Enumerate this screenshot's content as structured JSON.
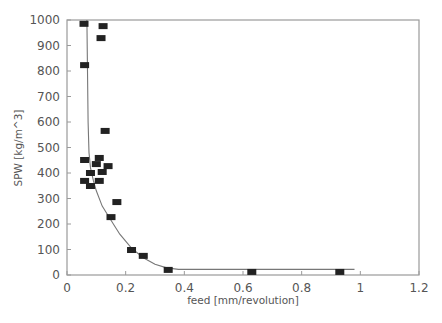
{
  "chart_data": {
    "type": "scatter",
    "title": "",
    "xlabel": "feed [mm/revolution]",
    "ylabel": "SPW [kg/m^3]",
    "xlim": [
      0,
      1.2
    ],
    "ylim": [
      0,
      1000
    ],
    "xticks": [
      0,
      0.2,
      0.4,
      0.6,
      0.8,
      1,
      1.2
    ],
    "xtick_labels": [
      "0",
      "0.2",
      "0.4",
      "0.6",
      "0.8",
      "1",
      "1.2"
    ],
    "yticks": [
      0,
      100,
      200,
      300,
      400,
      500,
      600,
      700,
      800,
      900,
      1000
    ],
    "ytick_labels": [
      "0",
      "100",
      "200",
      "300",
      "400",
      "500",
      "600",
      "700",
      "800",
      "900",
      "1000"
    ],
    "grid": false,
    "legend": null,
    "series": [
      {
        "name": "measured",
        "kind": "scatter",
        "marker": "rectangle",
        "color": "#222222",
        "points": [
          [
            0.058,
            985
          ],
          [
            0.123,
            976
          ],
          [
            0.116,
            929
          ],
          [
            0.06,
            823
          ],
          [
            0.13,
            565
          ],
          [
            0.06,
            451
          ],
          [
            0.11,
            459
          ],
          [
            0.1,
            435
          ],
          [
            0.14,
            427
          ],
          [
            0.08,
            400
          ],
          [
            0.12,
            404
          ],
          [
            0.06,
            369
          ],
          [
            0.11,
            369
          ],
          [
            0.08,
            349
          ],
          [
            0.17,
            286
          ],
          [
            0.15,
            227
          ],
          [
            0.22,
            98
          ],
          [
            0.26,
            75
          ],
          [
            0.345,
            20
          ],
          [
            0.63,
            12
          ],
          [
            0.93,
            12
          ]
        ]
      },
      {
        "name": "fit",
        "kind": "line",
        "color": "#777777",
        "points": [
          [
            0.068,
            1000
          ],
          [
            0.07,
            800
          ],
          [
            0.072,
            600
          ],
          [
            0.075,
            480
          ],
          [
            0.08,
            420
          ],
          [
            0.09,
            370
          ],
          [
            0.1,
            330
          ],
          [
            0.12,
            270
          ],
          [
            0.15,
            215
          ],
          [
            0.18,
            160
          ],
          [
            0.22,
            105
          ],
          [
            0.26,
            68
          ],
          [
            0.3,
            42
          ],
          [
            0.34,
            28
          ],
          [
            0.38,
            22
          ],
          [
            0.5,
            22
          ],
          [
            0.7,
            22
          ],
          [
            0.9,
            22
          ],
          [
            0.98,
            22
          ]
        ]
      }
    ]
  }
}
